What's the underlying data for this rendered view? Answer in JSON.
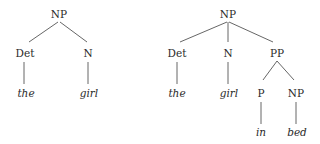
{
  "trees": [
    {
      "name": "the girl",
      "nodes": [
        {
          "id": "np",
          "label": "NP",
          "type": "category",
          "x": 59,
          "y": 14
        },
        {
          "id": "det",
          "label": "Det",
          "type": "category",
          "x": 25,
          "y": 53
        },
        {
          "id": "n",
          "label": "N",
          "type": "category",
          "x": 88,
          "y": 53
        },
        {
          "id": "the",
          "label": "the",
          "type": "word",
          "x": 26,
          "y": 93
        },
        {
          "id": "girl",
          "label": "girl",
          "type": "word",
          "x": 89,
          "y": 93
        }
      ],
      "edges": [
        {
          "from": "np",
          "to": "det",
          "x1": 58,
          "y1": 22,
          "x2": 29,
          "y2": 42
        },
        {
          "from": "np",
          "to": "n",
          "x1": 60,
          "y1": 22,
          "x2": 87,
          "y2": 42
        },
        {
          "from": "det",
          "to": "the",
          "x1": 24,
          "y1": 62,
          "x2": 24,
          "y2": 84
        },
        {
          "from": "n",
          "to": "girl",
          "x1": 88,
          "y1": 62,
          "x2": 88,
          "y2": 84
        }
      ]
    },
    {
      "name": "the girl in bed",
      "nodes": [
        {
          "id": "np",
          "label": "NP",
          "type": "category",
          "x": 228,
          "y": 14
        },
        {
          "id": "det",
          "label": "Det",
          "type": "category",
          "x": 177,
          "y": 53
        },
        {
          "id": "n",
          "label": "N",
          "type": "category",
          "x": 228,
          "y": 53
        },
        {
          "id": "pp",
          "label": "PP",
          "type": "category",
          "x": 277,
          "y": 53
        },
        {
          "id": "the",
          "label": "the",
          "type": "word",
          "x": 177,
          "y": 93
        },
        {
          "id": "girl",
          "label": "girl",
          "type": "word",
          "x": 229,
          "y": 93
        },
        {
          "id": "p",
          "label": "P",
          "type": "category",
          "x": 261,
          "y": 93
        },
        {
          "id": "np2",
          "label": "NP",
          "type": "category",
          "x": 296,
          "y": 93
        },
        {
          "id": "in",
          "label": "in",
          "type": "word",
          "x": 261,
          "y": 132
        },
        {
          "id": "bed",
          "label": "bed",
          "type": "word",
          "x": 297,
          "y": 132
        }
      ],
      "edges": [
        {
          "from": "np",
          "to": "det",
          "x1": 227,
          "y1": 22,
          "x2": 180,
          "y2": 42
        },
        {
          "from": "np",
          "to": "n",
          "x1": 228,
          "y1": 22,
          "x2": 228,
          "y2": 42
        },
        {
          "from": "np",
          "to": "pp",
          "x1": 229,
          "y1": 22,
          "x2": 273,
          "y2": 42
        },
        {
          "from": "det",
          "to": "the",
          "x1": 177,
          "y1": 62,
          "x2": 177,
          "y2": 84
        },
        {
          "from": "n",
          "to": "girl",
          "x1": 228,
          "y1": 62,
          "x2": 228,
          "y2": 84
        },
        {
          "from": "pp",
          "to": "p",
          "x1": 277,
          "y1": 61,
          "x2": 263,
          "y2": 80
        },
        {
          "from": "pp",
          "to": "np2",
          "x1": 277,
          "y1": 61,
          "x2": 294,
          "y2": 80
        },
        {
          "from": "p",
          "to": "in",
          "x1": 261,
          "y1": 102,
          "x2": 261,
          "y2": 124
        },
        {
          "from": "np2",
          "to": "bed",
          "x1": 296,
          "y1": 102,
          "x2": 296,
          "y2": 124
        }
      ]
    }
  ],
  "style": {
    "line_color": "#555555",
    "text_color": "#2a2a2a"
  }
}
